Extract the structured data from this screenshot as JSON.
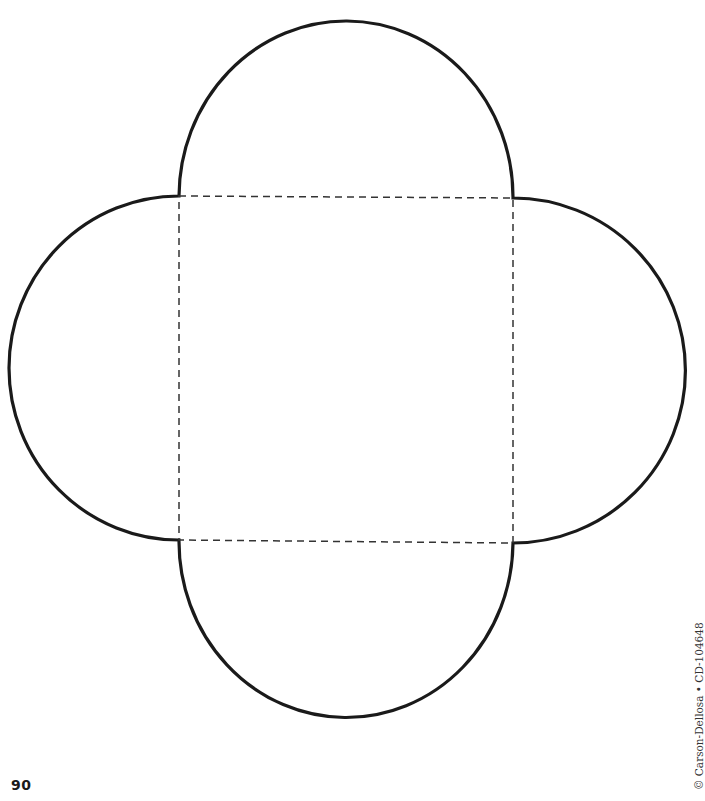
{
  "page": {
    "number": "90",
    "copyright": "© Carson-Dellosa • CD-104648"
  },
  "template": {
    "shape": "four-petal envelope pattern",
    "center_square": {
      "x1": 179,
      "y1": 196,
      "x2": 513,
      "y2": 542
    },
    "fold_lines": "dashed",
    "cut_outline": "solid",
    "stroke_color": "#1a1a1a",
    "dash_color": "#333333"
  }
}
